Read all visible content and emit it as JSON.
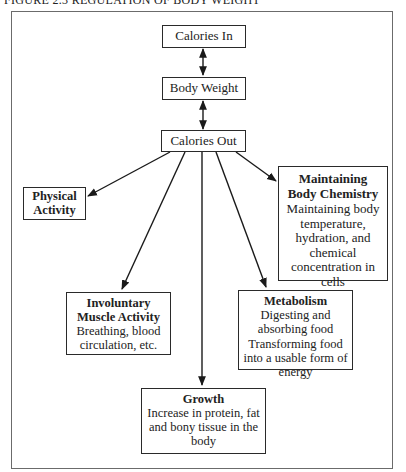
{
  "figure": {
    "title": "FIGURE 2.3  REGULATION OF BODY WEIGHT"
  },
  "nodes": {
    "calories_in": {
      "label": "Calories In"
    },
    "body_weight": {
      "label": "Body Weight"
    },
    "calories_out": {
      "label": "Calories Out"
    },
    "physical_activity": {
      "title": "Physical Activity"
    },
    "body_chemistry": {
      "title": "Maintaining Body Chemistry",
      "description": "Maintaining body temperature, hydration, and chemical concentration in cells"
    },
    "involuntary_muscle": {
      "title": "Involuntary Muscle Activity",
      "description": "Breathing, blood circulation, etc."
    },
    "metabolism": {
      "title": "Metabolism",
      "description_1": "Digesting and absorbing food",
      "description_2": "Transforming food into a usable form of energy"
    },
    "growth": {
      "title": "Growth",
      "description": "Increase in protein, fat and bony tissue in the body"
    }
  },
  "edges": [
    {
      "from": "calories_in",
      "to": "body_weight",
      "type": "bidirectional"
    },
    {
      "from": "body_weight",
      "to": "calories_out",
      "type": "bidirectional"
    },
    {
      "from": "calories_out",
      "to": "physical_activity",
      "type": "directed"
    },
    {
      "from": "calories_out",
      "to": "involuntary_muscle",
      "type": "directed"
    },
    {
      "from": "calories_out",
      "to": "growth",
      "type": "directed"
    },
    {
      "from": "calories_out",
      "to": "metabolism",
      "type": "directed"
    },
    {
      "from": "calories_out",
      "to": "body_chemistry",
      "type": "directed"
    }
  ]
}
